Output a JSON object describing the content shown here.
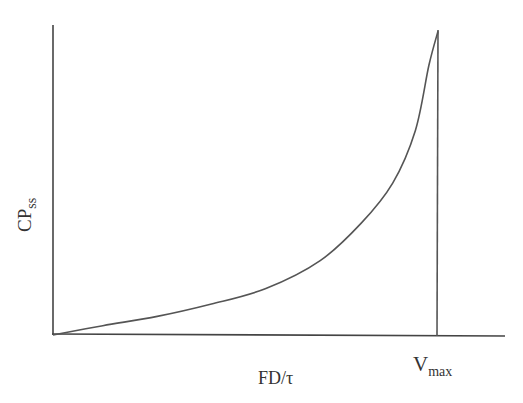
{
  "chart_data": {
    "type": "line",
    "title": "",
    "xlabel": "FD/τ",
    "ylabel": "CP_ss",
    "ylabel_main": "CP",
    "ylabel_sub": "ss",
    "grid": false,
    "legend": null,
    "annotations": [
      {
        "type": "vertical_line",
        "label": "V_max",
        "label_main": "V",
        "label_sub": "max",
        "x_fraction": 0.85
      }
    ],
    "x_fraction": [
      0.0,
      0.11,
      0.23,
      0.35,
      0.47,
      0.59,
      0.68,
      0.75,
      0.8,
      0.83,
      0.85
    ],
    "series": [
      {
        "name": "CP_ss vs FD/τ",
        "x": [
          0.0,
          0.11,
          0.23,
          0.35,
          0.47,
          0.59,
          0.68,
          0.75,
          0.8,
          0.83,
          0.85
        ],
        "y": [
          0.0,
          0.03,
          0.06,
          0.1,
          0.15,
          0.24,
          0.36,
          0.49,
          0.66,
          0.87,
          0.98
        ]
      }
    ],
    "xlim": [
      0,
      1.1
    ],
    "ylim": [
      0,
      1.0
    ],
    "tick_labels": false
  },
  "colors": {
    "axis": "#444444",
    "curve": "#555555",
    "text": "#333333"
  }
}
